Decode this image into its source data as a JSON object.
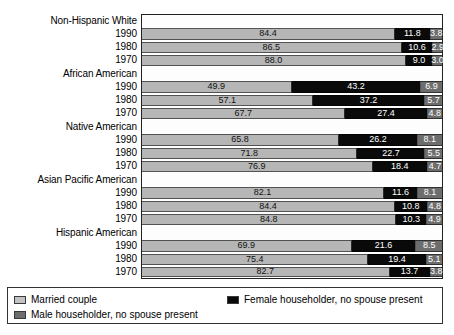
{
  "chart_data": {
    "type": "bar",
    "orientation": "horizontal",
    "stacked": true,
    "percent_total": 100,
    "title": "",
    "xlabel": "",
    "ylabel": "",
    "xlim": [
      0,
      100
    ],
    "grid": false,
    "legend_position": "bottom",
    "series": [
      {
        "name": "Married couple",
        "color": "#c2c2c2"
      },
      {
        "name": "Female householder, no spouse present",
        "color": "#0a0a0a"
      },
      {
        "name": "Male householder, no spouse present",
        "color": "#6d6d6d"
      }
    ],
    "groups": [
      {
        "label": "Non-Hispanic White",
        "rows": [
          {
            "label": "1990",
            "values": [
              84.4,
              11.8,
              3.8
            ]
          },
          {
            "label": "1980",
            "values": [
              86.5,
              10.6,
              2.9
            ]
          },
          {
            "label": "1970",
            "values": [
              88.0,
              9.0,
              3.0
            ]
          }
        ]
      },
      {
        "label": "African American",
        "rows": [
          {
            "label": "1990",
            "values": [
              49.9,
              43.2,
              6.9
            ]
          },
          {
            "label": "1980",
            "values": [
              57.1,
              37.2,
              5.7
            ]
          },
          {
            "label": "1970",
            "values": [
              67.7,
              27.4,
              4.8
            ]
          }
        ]
      },
      {
        "label": "Native American",
        "rows": [
          {
            "label": "1990",
            "values": [
              65.8,
              26.2,
              8.1
            ]
          },
          {
            "label": "1980",
            "values": [
              71.8,
              22.7,
              5.5
            ]
          },
          {
            "label": "1970",
            "values": [
              76.9,
              18.4,
              4.7
            ]
          }
        ]
      },
      {
        "label": "Asian Pacific American",
        "rows": [
          {
            "label": "1990",
            "values": [
              82.1,
              11.6,
              8.1
            ]
          },
          {
            "label": "1980",
            "values": [
              84.4,
              10.8,
              4.8
            ]
          },
          {
            "label": "1970",
            "values": [
              84.8,
              10.3,
              4.9
            ]
          }
        ]
      },
      {
        "label": "Hispanic American",
        "rows": [
          {
            "label": "1990",
            "values": [
              69.9,
              21.6,
              8.5
            ]
          },
          {
            "label": "1980",
            "values": [
              75.4,
              19.4,
              5.1
            ]
          },
          {
            "label": "1970",
            "values": [
              82.7,
              13.7,
              3.8
            ]
          }
        ]
      }
    ]
  },
  "legend": {
    "items": [
      {
        "label": "Married couple",
        "swatch": "sw-married",
        "name": "legend-swatch-married-couple"
      },
      {
        "label": "Female householder, no spouse present",
        "swatch": "sw-female",
        "name": "legend-swatch-female-householder"
      },
      {
        "label": "Male householder, no spouse present",
        "swatch": "sw-male",
        "name": "legend-swatch-male-householder"
      }
    ]
  }
}
